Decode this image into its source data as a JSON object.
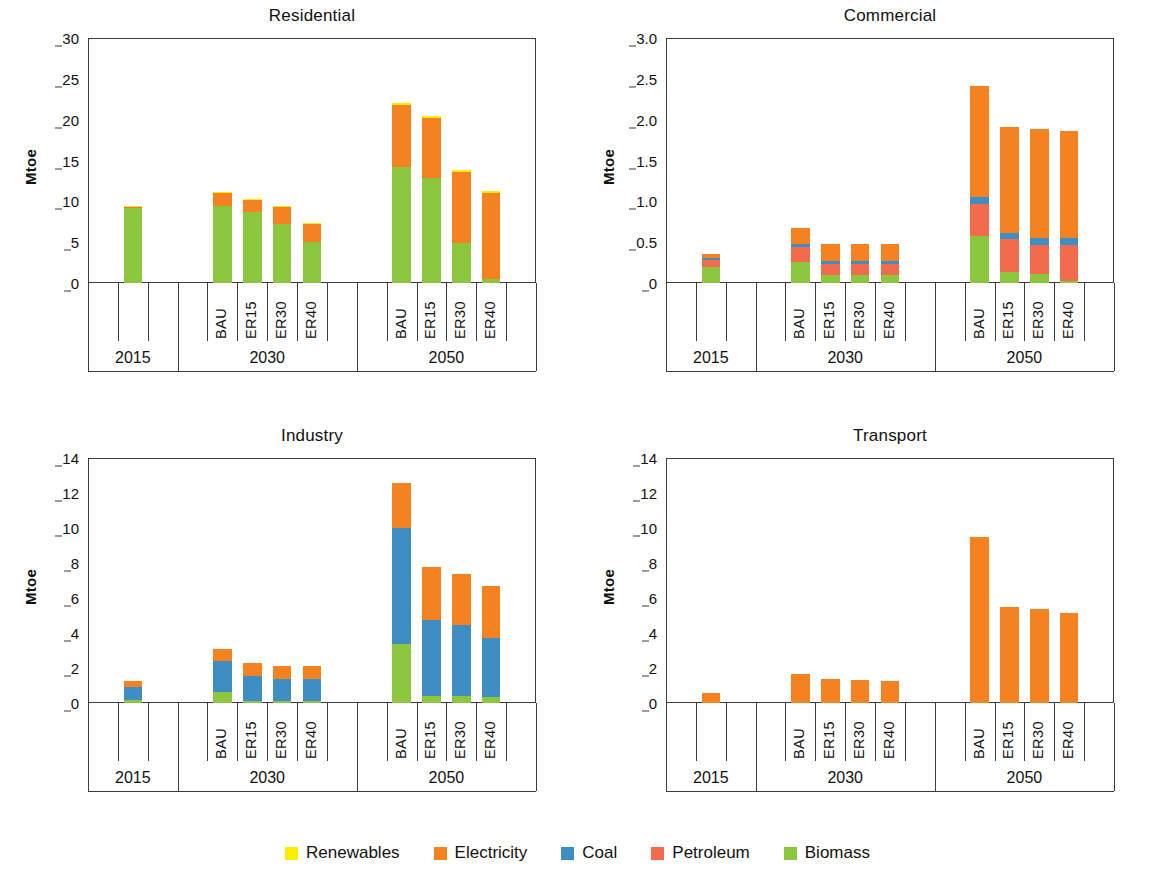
{
  "chart_data": [
    {
      "type": "bar",
      "title": "Residential",
      "xlabel": "",
      "ylabel": "Mtoe",
      "ylim": [
        0,
        30
      ],
      "yticks": [
        0,
        5,
        10,
        15,
        20,
        25,
        30
      ],
      "ytick_labels": [
        "0",
        "5",
        "10",
        "15",
        "20",
        "25",
        "30"
      ],
      "grid": false,
      "stacked": true,
      "groups": [
        {
          "label": "2015",
          "categories": [
            ""
          ]
        },
        {
          "label": "2030",
          "categories": [
            "BAU",
            "ER15",
            "ER30",
            "ER40"
          ]
        },
        {
          "label": "2050",
          "categories": [
            "BAU",
            "ER15",
            "ER30",
            "ER40"
          ]
        }
      ],
      "series": [
        {
          "name": "Biomass",
          "color": "#8CC63E",
          "values": [
            9.2,
            9.45,
            8.65,
            7.2,
            5.05,
            14.25,
            12.8,
            4.95,
            0.55
          ]
        },
        {
          "name": "Petroleum",
          "color": "#F26B4C",
          "values": [
            0.1,
            0.0,
            0.0,
            0.0,
            0.0,
            0.0,
            0.0,
            0.0,
            0.0
          ]
        },
        {
          "name": "Coal",
          "color": "#3E8EC4",
          "values": [
            0.0,
            0.0,
            0.0,
            0.0,
            0.0,
            0.0,
            0.0,
            0.0,
            0.0
          ]
        },
        {
          "name": "Electricity",
          "color": "#F58220",
          "values": [
            0.1,
            1.6,
            1.55,
            2.2,
            2.3,
            7.5,
            7.45,
            8.7,
            10.5
          ]
        },
        {
          "name": "Renewables",
          "color": "#FFEC00",
          "values": [
            0.05,
            0.05,
            0.05,
            0.05,
            0.05,
            0.25,
            0.15,
            0.25,
            0.25
          ]
        }
      ]
    },
    {
      "type": "bar",
      "title": "Commercial",
      "xlabel": "",
      "ylabel": "Mtoe",
      "ylim": [
        0,
        3.0
      ],
      "yticks": [
        0,
        0.5,
        1.0,
        1.5,
        2.0,
        2.5,
        3.0
      ],
      "ytick_labels": [
        "0",
        "0.5",
        "1.0",
        "1.5",
        "2.0",
        "2.5",
        "3.0"
      ],
      "grid": false,
      "stacked": true,
      "groups": [
        {
          "label": "2015",
          "categories": [
            ""
          ]
        },
        {
          "label": "2030",
          "categories": [
            "BAU",
            "ER15",
            "ER30",
            "ER40"
          ]
        },
        {
          "label": "2050",
          "categories": [
            "BAU",
            "ER15",
            "ER30",
            "ER40"
          ]
        }
      ],
      "series": [
        {
          "name": "Biomass",
          "color": "#8CC63E",
          "values": [
            0.2,
            0.26,
            0.1,
            0.1,
            0.1,
            0.57,
            0.14,
            0.11,
            0.02
          ]
        },
        {
          "name": "Petroleum",
          "color": "#F26B4C",
          "values": [
            0.08,
            0.18,
            0.13,
            0.13,
            0.13,
            0.4,
            0.4,
            0.36,
            0.45
          ]
        },
        {
          "name": "Coal",
          "color": "#3E8EC4",
          "values": [
            0.03,
            0.04,
            0.04,
            0.04,
            0.04,
            0.08,
            0.07,
            0.08,
            0.08
          ]
        },
        {
          "name": "Electricity",
          "color": "#F58220",
          "values": [
            0.05,
            0.19,
            0.21,
            0.21,
            0.21,
            1.36,
            1.3,
            1.33,
            1.31
          ]
        },
        {
          "name": "Renewables",
          "color": "#FFEC00",
          "values": [
            0.0,
            0.0,
            0.0,
            0.0,
            0.0,
            0.0,
            0.0,
            0.0,
            0.0
          ]
        }
      ]
    },
    {
      "type": "bar",
      "title": "Industry",
      "xlabel": "",
      "ylabel": "Mtoe",
      "ylim": [
        0,
        14
      ],
      "yticks": [
        0,
        2,
        4,
        6,
        8,
        10,
        12,
        14
      ],
      "ytick_labels": [
        "0",
        "2",
        "4",
        "6",
        "8",
        "10",
        "12",
        "14"
      ],
      "grid": false,
      "stacked": true,
      "groups": [
        {
          "label": "2015",
          "categories": [
            ""
          ]
        },
        {
          "label": "2030",
          "categories": [
            "BAU",
            "ER15",
            "ER30",
            "ER40"
          ]
        },
        {
          "label": "2050",
          "categories": [
            "BAU",
            "ER15",
            "ER30",
            "ER40"
          ]
        }
      ],
      "series": [
        {
          "name": "Biomass",
          "color": "#8CC63E",
          "values": [
            0.15,
            0.65,
            0.1,
            0.1,
            0.1,
            3.35,
            0.4,
            0.4,
            0.35
          ]
        },
        {
          "name": "Petroleum",
          "color": "#F26B4C",
          "values": [
            0.0,
            0.0,
            0.0,
            0.0,
            0.0,
            0.0,
            0.0,
            0.0,
            0.0
          ]
        },
        {
          "name": "Coal",
          "color": "#3E8EC4",
          "values": [
            0.75,
            1.75,
            1.45,
            1.25,
            1.25,
            6.65,
            4.35,
            4.05,
            3.35
          ]
        },
        {
          "name": "Electricity",
          "color": "#F58220",
          "values": [
            0.35,
            0.7,
            0.75,
            0.75,
            0.75,
            2.6,
            3.05,
            2.95,
            3.0
          ]
        },
        {
          "name": "Renewables",
          "color": "#FFEC00",
          "values": [
            0.0,
            0.0,
            0.0,
            0.0,
            0.0,
            0.0,
            0.0,
            0.0,
            0.0
          ]
        }
      ]
    },
    {
      "type": "bar",
      "title": "Transport",
      "xlabel": "",
      "ylabel": "Mtoe",
      "ylim": [
        0,
        14
      ],
      "yticks": [
        0,
        2,
        4,
        6,
        8,
        10,
        12,
        14
      ],
      "ytick_labels": [
        "0",
        "2",
        "4",
        "6",
        "8",
        "10",
        "12",
        "14"
      ],
      "grid": false,
      "stacked": true,
      "groups": [
        {
          "label": "2015",
          "categories": [
            ""
          ]
        },
        {
          "label": "2030",
          "categories": [
            "BAU",
            "ER15",
            "ER30",
            "ER40"
          ]
        },
        {
          "label": "2050",
          "categories": [
            "BAU",
            "ER15",
            "ER30",
            "ER40"
          ]
        }
      ],
      "series": [
        {
          "name": "Biomass",
          "color": "#8CC63E",
          "values": [
            0.0,
            0.0,
            0.0,
            0.0,
            0.0,
            0.0,
            0.0,
            0.0,
            0.0
          ]
        },
        {
          "name": "Petroleum",
          "color": "#F26B4C",
          "values": [
            0.0,
            0.0,
            0.0,
            0.0,
            0.0,
            0.0,
            0.0,
            0.0,
            0.0
          ]
        },
        {
          "name": "Coal",
          "color": "#3E8EC4",
          "values": [
            0.0,
            0.0,
            0.0,
            0.0,
            0.0,
            0.0,
            0.0,
            0.0,
            0.0
          ]
        },
        {
          "name": "Electricity",
          "color": "#F58220",
          "values": [
            0.6,
            1.65,
            1.4,
            1.3,
            1.28,
            9.5,
            5.5,
            5.35,
            5.15
          ]
        },
        {
          "name": "Renewables",
          "color": "#FFEC00",
          "values": [
            0.0,
            0.0,
            0.0,
            0.0,
            0.0,
            0.0,
            0.0,
            0.0,
            0.0
          ]
        }
      ]
    }
  ],
  "legend": {
    "position": "bottom",
    "items": [
      {
        "label": "Renewables",
        "color": "#FFEC00"
      },
      {
        "label": "Electricity",
        "color": "#F58220"
      },
      {
        "label": "Coal",
        "color": "#3E8EC4"
      },
      {
        "label": "Petroleum",
        "color": "#F26B4C"
      },
      {
        "label": "Biomass",
        "color": "#8CC63E"
      }
    ]
  },
  "layout": {
    "panels": [
      {
        "key": "residential",
        "left": 0,
        "top": 0,
        "width": 578,
        "height": 400
      },
      {
        "key": "commercial",
        "left": 578,
        "top": 0,
        "width": 577,
        "height": 400
      },
      {
        "key": "industry",
        "left": 0,
        "top": 420,
        "width": 578,
        "height": 400
      },
      {
        "key": "transport",
        "left": 578,
        "top": 420,
        "width": 577,
        "height": 400
      }
    ]
  }
}
